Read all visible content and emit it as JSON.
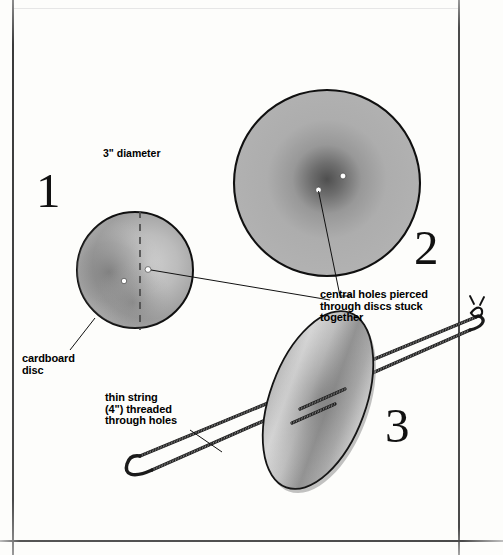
{
  "page": {
    "background_color": "#fdfdfb",
    "ink_color": "#000000"
  },
  "steps": [
    {
      "number": "1",
      "caption": "front view of single cardboard disc with two pierced holes"
    },
    {
      "number": "2",
      "caption": "two discs stuck together seen face on"
    },
    {
      "number": "3",
      "caption": "string threaded through the holes and looped"
    }
  ],
  "labels": {
    "diameter": "3\" diameter",
    "cardboard_disc": "cardboard\ndisc",
    "central_holes": "central holes pierced\nthrough discs stuck\ntogether",
    "thin_string": "thin string\n(4\") threaded\nthrough holes"
  },
  "colors": {
    "disc_light": "#c9c9c9",
    "disc_mid": "#a3a3a3",
    "disc_dark": "#5d5d5d",
    "outline": "#111111",
    "string": "#1a1a1a",
    "hole": "#ffffff"
  },
  "geometry": {
    "disc1": {
      "cx": 135,
      "cy": 270,
      "r": 58
    },
    "disc2": {
      "cx": 327,
      "cy": 183,
      "r": 93
    },
    "disc3": {
      "cx": 318,
      "cy": 400,
      "rx": 48,
      "ry": 93,
      "rotation_deg": 20
    },
    "holes_disc1": [
      {
        "x": 124,
        "y": 281
      },
      {
        "x": 148,
        "y": 270
      }
    ],
    "holes_disc2": [
      {
        "x": 318,
        "y": 190
      },
      {
        "x": 343,
        "y": 176
      }
    ]
  }
}
